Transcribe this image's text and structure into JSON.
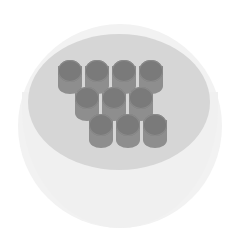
{
  "illustration": {
    "subject": "cup-with-cylinders",
    "colors": {
      "background": "#ffffff",
      "cup_body": "#f2f2f2",
      "cup_rim": "#d6d6d6",
      "cylinder_side": "#8e8e8e",
      "cylinder_top": "#7a7a7a"
    },
    "cylinders": [
      {
        "row": 1,
        "x": 58,
        "y": 60
      },
      {
        "row": 1,
        "x": 85,
        "y": 60
      },
      {
        "row": 1,
        "x": 112,
        "y": 60
      },
      {
        "row": 1,
        "x": 139,
        "y": 60
      },
      {
        "row": 2,
        "x": 75,
        "y": 87
      },
      {
        "row": 2,
        "x": 102,
        "y": 87
      },
      {
        "row": 2,
        "x": 129,
        "y": 87
      },
      {
        "row": 3,
        "x": 89,
        "y": 114
      },
      {
        "row": 3,
        "x": 116,
        "y": 114
      },
      {
        "row": 3,
        "x": 143,
        "y": 114
      }
    ]
  }
}
